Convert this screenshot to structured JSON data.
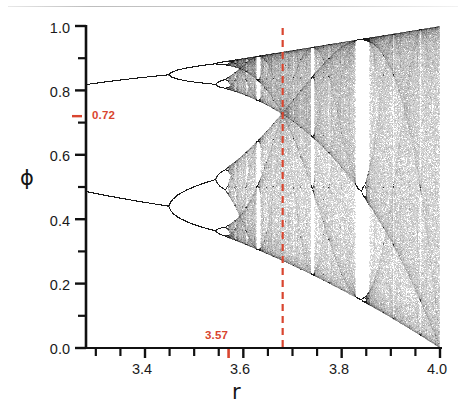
{
  "figure": {
    "kind": "bifurcation-diagram",
    "accent_red": "#d9452f",
    "ink": "#151515",
    "background": "#ffffff"
  },
  "axes": {
    "x_title": "r",
    "y_title": "ϕ",
    "x_tick_labels": [
      "3.4",
      "3.6",
      "3.8",
      "4.0"
    ],
    "x_tick_values": [
      3.4,
      3.6,
      3.8,
      4.0
    ],
    "y_tick_labels": [
      "0.0",
      "0.2",
      "0.4",
      "0.6",
      "0.8",
      "1.0"
    ],
    "y_tick_values": [
      0.0,
      0.2,
      0.4,
      0.6,
      0.8,
      1.0
    ],
    "x_minor_values": [
      3.3,
      3.35,
      3.45,
      3.5,
      3.55,
      3.65,
      3.7,
      3.75,
      3.85,
      3.9,
      3.95
    ],
    "y_minor_values": [
      0.1,
      0.3,
      0.5,
      0.7,
      0.9
    ],
    "xlim": [
      3.28,
      4.0
    ],
    "ylim": [
      0.0,
      1.0
    ]
  },
  "annotations": {
    "vline_label": "3.57",
    "vline_r": 3.57,
    "dashed_line_r": 3.68,
    "hmark_label": "0.72",
    "hmark_phi": 0.72
  },
  "chart_data": {
    "type": "scatter",
    "title": "",
    "xlabel": "r",
    "ylabel": "ϕ",
    "xlim": [
      3.28,
      4.0
    ],
    "ylim": [
      0.0,
      1.0
    ],
    "grid": false,
    "legend": "none",
    "map_equation": "ϕₙ₊₁ = r ϕₙ (1 − ϕₙ)",
    "r_start": 3.28,
    "r_end": 4.0,
    "r_steps": 1100,
    "iterations_transient": 400,
    "iterations_plotted": 260,
    "seed_phi": 0.37,
    "point_color": "#101010",
    "point_alpha": 0.14,
    "point_size": 0.65,
    "features": {
      "period_2_band_top_at_left": 0.83,
      "period_2_band_bottom_at_left": 0.47,
      "period_4_onset_r": 3.449,
      "period_8_onset_r": 3.544,
      "feigenbaum_accumulation_r": 3.5699,
      "period_3_window_r": [
        3.828,
        3.857
      ],
      "period_5_window_r": [
        3.738,
        3.745
      ],
      "period_6_window_r": [
        3.626,
        3.635
      ],
      "band_merge_r": 3.6786,
      "band_merge_phi": 0.72,
      "upper_envelope_at_r4": 1.0,
      "lower_envelope_at_r4": 0.0
    },
    "marked_points": [
      {
        "r": 3.57,
        "label": "3.57",
        "axis": "x",
        "meaning": "onset of chaos"
      },
      {
        "phi": 0.72,
        "label": "0.72",
        "axis": "y",
        "meaning": "band-merging value"
      },
      {
        "r": 3.68,
        "label": "",
        "axis": "x",
        "meaning": "dashed reference line"
      }
    ]
  }
}
